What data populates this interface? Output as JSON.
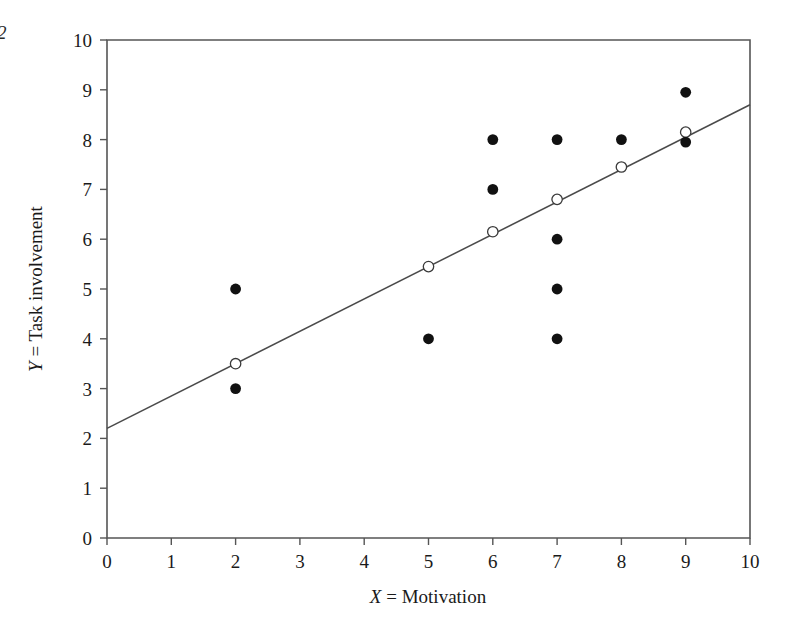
{
  "page_number": "2",
  "chart_data": {
    "type": "scatter",
    "title": "",
    "xlabel_var": "X",
    "xlabel_rest": " = Motivation",
    "xlabel": "X = Motivation",
    "ylabel_var": "Y",
    "ylabel_rest": " = Task involvement",
    "ylabel": "Y = Task involvement",
    "xlim": [
      0,
      10
    ],
    "ylim": [
      0,
      10
    ],
    "xticks": [
      0,
      1,
      2,
      3,
      4,
      5,
      6,
      7,
      8,
      9,
      10
    ],
    "yticks": [
      0,
      1,
      2,
      3,
      4,
      5,
      6,
      7,
      8,
      9,
      10
    ],
    "xtick_labels": [
      "0",
      "1",
      "2",
      "3",
      "4",
      "5",
      "6",
      "7",
      "8",
      "9",
      "10"
    ],
    "ytick_labels": [
      "0",
      "1",
      "2",
      "3",
      "4",
      "5",
      "6",
      "7",
      "8",
      "9",
      "10"
    ],
    "grid": false,
    "legend": false,
    "series": [
      {
        "name": "Observed scores",
        "marker": "filled-circle",
        "color": "#111111",
        "points": [
          {
            "x": 2,
            "y": 5
          },
          {
            "x": 2,
            "y": 3
          },
          {
            "x": 5,
            "y": 4
          },
          {
            "x": 6,
            "y": 8
          },
          {
            "x": 6,
            "y": 7
          },
          {
            "x": 7,
            "y": 8
          },
          {
            "x": 7,
            "y": 6
          },
          {
            "x": 7,
            "y": 5
          },
          {
            "x": 7,
            "y": 4
          },
          {
            "x": 8,
            "y": 8
          },
          {
            "x": 9,
            "y": 8.95
          },
          {
            "x": 9,
            "y": 7.95
          }
        ]
      },
      {
        "name": "Predicted scores",
        "marker": "open-circle",
        "color": "#ffffff",
        "points": [
          {
            "x": 2,
            "y": 3.5
          },
          {
            "x": 5,
            "y": 5.45
          },
          {
            "x": 6,
            "y": 6.15
          },
          {
            "x": 7,
            "y": 6.8
          },
          {
            "x": 8,
            "y": 7.45
          },
          {
            "x": 9,
            "y": 8.15
          }
        ]
      }
    ],
    "regression_line": {
      "name": "Regression line",
      "x_start": 0,
      "y_start": 2.2,
      "x_end": 10,
      "y_end": 8.7,
      "slope": 0.65,
      "intercept": 2.2,
      "color": "#4a4a4a"
    }
  }
}
